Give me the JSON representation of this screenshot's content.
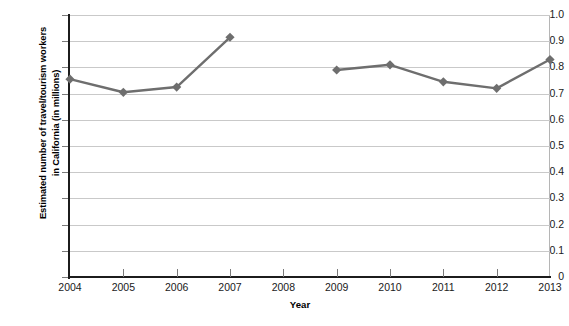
{
  "chart_data": {
    "type": "line",
    "title": "",
    "xlabel": "Year",
    "ylabel": "Estimated number of travel/tourism workers\nin California (in millions)",
    "categories": [
      "2004",
      "2005",
      "2006",
      "2007",
      "2008",
      "2009",
      "2010",
      "2011",
      "2012",
      "2013"
    ],
    "x": [
      2004,
      2005,
      2006,
      2007,
      2008,
      2009,
      2010,
      2011,
      2012,
      2013
    ],
    "values": [
      0.755,
      0.705,
      0.725,
      0.915,
      null,
      0.79,
      0.81,
      0.745,
      0.72,
      0.83
    ],
    "series": [
      {
        "name": "Estimated number of travel/tourism workers in California",
        "values": [
          0.755,
          0.705,
          0.725,
          0.915,
          null,
          0.79,
          0.81,
          0.745,
          0.72,
          0.83
        ]
      }
    ],
    "missing_years": [
      2008
    ],
    "ylim": [
      0,
      1.0
    ],
    "xlim": [
      2004,
      2013
    ],
    "ytick_labels": [
      "0",
      "0.1",
      "0.2",
      "0.3",
      "0.4",
      "0.5",
      "0.6",
      "0.7",
      "0.8",
      "0.9",
      "1.0"
    ],
    "ytick_values": [
      0,
      0.1,
      0.2,
      0.3,
      0.4,
      0.5,
      0.6,
      0.7,
      0.8,
      0.9,
      1.0
    ],
    "xtick_labels": [
      "2004",
      "2005",
      "2006",
      "2007",
      "2008",
      "2009",
      "2010",
      "2011",
      "2012",
      "2013"
    ],
    "grid": "horizontal",
    "legend": "none",
    "marker": "diamond",
    "colors": {
      "line": "#6e6e6e",
      "marker": "#6e6e6e",
      "gridline": "#c9c9c9",
      "axis": "#1c1c1c",
      "text": "#1a1a1a",
      "background": "#ffffff"
    }
  }
}
